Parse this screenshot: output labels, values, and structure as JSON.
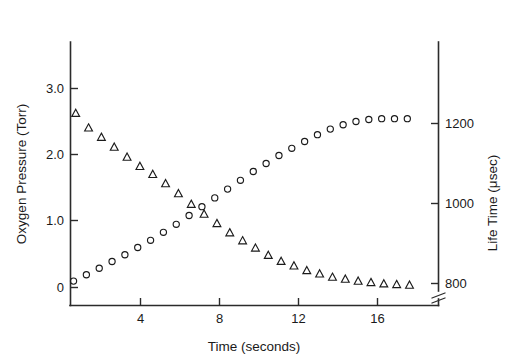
{
  "chart_data": {
    "type": "scatter",
    "title": "",
    "xlabel": "Time (seconds)",
    "ylabel": "Oxygen Pressure (Torr)",
    "y2label": "Life Time (μsec)",
    "xlim": [
      0,
      18.6
    ],
    "ylim": [
      -0.27,
      3.97
    ],
    "y2lim": [
      780,
      1306
    ],
    "xticks": [
      4,
      8,
      12,
      16
    ],
    "xticklabels": [
      "4",
      "8",
      "12",
      "16"
    ],
    "yticks": [
      0,
      1.0,
      2.0,
      3.0
    ],
    "yticklabels": [
      "0",
      "1.0",
      "2.0",
      "3.0"
    ],
    "y2ticks": [
      800,
      1000,
      1200
    ],
    "y2ticklabels": [
      "800",
      "1000",
      "1200"
    ],
    "grid": false,
    "legend": "none",
    "y2_axis_break": true,
    "series": [
      {
        "name": "Oxygen Pressure",
        "marker": "triangle",
        "axis": "left",
        "units": "Torr",
        "x": [
          0.72,
          1.37,
          2.02,
          2.67,
          3.32,
          3.97,
          4.62,
          5.27,
          5.92,
          6.57,
          7.22,
          7.87,
          8.52,
          9.17,
          9.82,
          10.47,
          11.12,
          11.77,
          12.42,
          13.07,
          13.72,
          14.37,
          15.02,
          15.67,
          16.32,
          16.97,
          17.62
        ],
        "y": [
          2.62,
          2.4,
          2.26,
          2.11,
          1.96,
          1.82,
          1.7,
          1.56,
          1.41,
          1.25,
          1.1,
          0.96,
          0.82,
          0.7,
          0.59,
          0.48,
          0.39,
          0.32,
          0.25,
          0.2,
          0.15,
          0.12,
          0.09,
          0.07,
          0.05,
          0.04,
          0.03
        ]
      },
      {
        "name": "Life Time",
        "marker": "circle",
        "axis": "right",
        "units": "μsec",
        "x": [
          0.61,
          1.26,
          1.91,
          2.56,
          3.21,
          3.86,
          4.51,
          5.16,
          5.81,
          6.46,
          7.11,
          7.76,
          8.41,
          9.06,
          9.71,
          10.36,
          11.01,
          11.66,
          12.31,
          12.96,
          13.61,
          14.26,
          14.91,
          15.56,
          16.21,
          16.86,
          17.51
        ],
        "y": [
          806,
          822,
          838,
          855,
          872,
          890,
          908,
          928,
          948,
          970,
          992,
          1014,
          1036,
          1058,
          1080,
          1100,
          1120,
          1138,
          1155,
          1172,
          1186,
          1197,
          1205,
          1210,
          1212,
          1212,
          1212
        ]
      }
    ]
  },
  "figure": {
    "caption": ""
  }
}
